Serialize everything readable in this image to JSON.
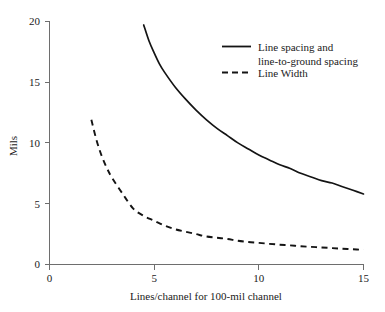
{
  "chart_data": {
    "type": "line",
    "title": "",
    "xlabel": "Lines/channel for 100-mil channel",
    "ylabel": "Mils",
    "xlim": [
      0,
      15
    ],
    "ylim": [
      0,
      20
    ],
    "xticks": [
      0,
      5,
      10,
      15
    ],
    "xtick_labels": [
      "0",
      "5",
      "10",
      "15"
    ],
    "yticks": [
      0,
      5,
      10,
      15,
      20
    ],
    "ytick_labels": [
      "0",
      "5",
      "10",
      "15",
      "20"
    ],
    "grid": false,
    "legend_position": "upper right",
    "series": [
      {
        "name": "Line spacing and line-to-ground spacing",
        "legend_label_line1": "Line spacing and",
        "legend_label_line2": "line-to-ground spacing",
        "style": "solid",
        "color": "#141414",
        "x": [
          4.5,
          4.75,
          5.0,
          5.25,
          5.5,
          6.0,
          6.5,
          7.0,
          7.5,
          8.0,
          8.5,
          9.0,
          9.5,
          10.0,
          10.5,
          11.0,
          11.5,
          12.0,
          12.5,
          13.0,
          13.5,
          14.0,
          14.5,
          15.0
        ],
        "y": [
          19.7,
          18.4,
          17.4,
          16.5,
          15.8,
          14.6,
          13.6,
          12.7,
          11.9,
          11.2,
          10.6,
          10.0,
          9.5,
          9.0,
          8.6,
          8.2,
          7.9,
          7.5,
          7.2,
          6.9,
          6.7,
          6.4,
          6.1,
          5.8
        ]
      },
      {
        "name": "Line Width",
        "legend_label_line1": "Line Width",
        "legend_label_line2": "",
        "style": "dashed",
        "color": "#141414",
        "x": [
          2.0,
          2.25,
          2.5,
          2.75,
          3.0,
          3.5,
          4.0,
          4.5,
          5.0,
          5.5,
          6.0,
          6.5,
          7.0,
          7.5,
          8.0,
          8.5,
          9.0,
          9.5,
          10.0,
          10.5,
          11.0,
          11.5,
          12.0,
          12.5,
          13.0,
          13.5,
          14.0,
          14.5,
          15.0
        ],
        "y": [
          11.9,
          10.2,
          8.9,
          7.9,
          7.1,
          5.8,
          4.6,
          4.0,
          3.6,
          3.2,
          2.9,
          2.7,
          2.5,
          2.3,
          2.2,
          2.1,
          1.95,
          1.85,
          1.78,
          1.7,
          1.63,
          1.57,
          1.5,
          1.45,
          1.4,
          1.35,
          1.3,
          1.25,
          1.2
        ]
      }
    ]
  },
  "axes": {
    "y_title": "Mils",
    "x_title": "Lines/channel for 100-mil channel"
  }
}
